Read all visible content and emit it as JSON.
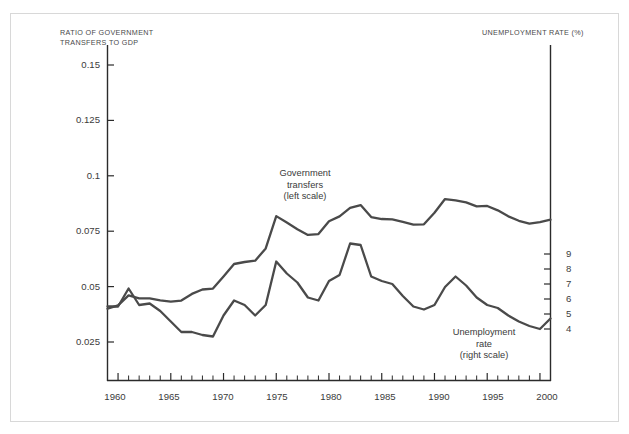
{
  "figure": {
    "background_color": "#ffffff",
    "frame_color": "#d8d8d8",
    "line_color": "#4a4a4a",
    "axis_color": "#2b2b2b"
  },
  "axes": {
    "left_title": "RATIO OF GOVERNMENT\nTRANSFERS TO GDP",
    "right_title": "UNEMPLOYMENT RATE (%)",
    "left_ticks": [
      "0.15",
      "0.125",
      "0.1",
      "0.075",
      "0.05",
      "0.025"
    ],
    "right_ticks": [
      "9",
      "8",
      "7",
      "6",
      "5",
      "4"
    ],
    "x_ticks": [
      "1960",
      "1965",
      "1970",
      "1975",
      "1980",
      "1985",
      "1990",
      "1995",
      "2000"
    ]
  },
  "annotations": {
    "transfers": "Government\ntransfers\n(left scale)",
    "unemployment": "Unemployment\nrate\n(right scale)"
  },
  "chart_data": {
    "type": "line",
    "title": "",
    "xlabel": "",
    "ylabel": "RATIO OF GOVERNMENT TRANSFERS TO GDP",
    "ylabel_right": "UNEMPLOYMENT RATE (%)",
    "grid": false,
    "legend": "inline-annotations",
    "xlim": [
      1959,
      2001
    ],
    "ylim_left": [
      0.0,
      0.1625
    ],
    "ylim_right": [
      3.0,
      10.6
    ],
    "x": [
      1959,
      1960,
      1961,
      1962,
      1963,
      1964,
      1965,
      1966,
      1967,
      1968,
      1969,
      1970,
      1971,
      1972,
      1973,
      1974,
      1975,
      1976,
      1977,
      1978,
      1979,
      1980,
      1981,
      1982,
      1983,
      1984,
      1985,
      1986,
      1987,
      1988,
      1989,
      1990,
      1991,
      1992,
      1993,
      1994,
      1995,
      1996,
      1997,
      1998,
      1999,
      2000,
      2001
    ],
    "series": [
      {
        "name": "Government transfers (left scale)",
        "axis": "left",
        "units": "ratio of GDP",
        "values": [
          0.04,
          0.0415,
          0.046,
          0.0447,
          0.0447,
          0.0438,
          0.0432,
          0.0437,
          0.0467,
          0.0487,
          0.0491,
          0.0546,
          0.0602,
          0.0611,
          0.0617,
          0.0672,
          0.0818,
          0.0789,
          0.0759,
          0.0733,
          0.0737,
          0.0795,
          0.0817,
          0.0855,
          0.0868,
          0.0814,
          0.0805,
          0.0803,
          0.0792,
          0.078,
          0.0781,
          0.0833,
          0.0895,
          0.0889,
          0.088,
          0.0862,
          0.0864,
          0.0844,
          0.0817,
          0.0797,
          0.0784,
          0.0791,
          0.0802
        ]
      },
      {
        "name": "Unemployment rate (right scale)",
        "axis": "right",
        "units": "percent",
        "values": [
          5.5,
          5.5,
          6.7,
          5.6,
          5.7,
          5.2,
          4.5,
          3.8,
          3.8,
          3.6,
          3.5,
          4.9,
          5.9,
          5.6,
          4.9,
          5.6,
          8.5,
          7.7,
          7.1,
          6.1,
          5.9,
          7.2,
          7.6,
          9.7,
          9.6,
          7.5,
          7.2,
          7.0,
          6.2,
          5.5,
          5.3,
          5.6,
          6.8,
          7.5,
          6.9,
          6.1,
          5.6,
          5.4,
          4.9,
          4.5,
          4.2,
          4.0,
          4.7
        ]
      }
    ]
  }
}
